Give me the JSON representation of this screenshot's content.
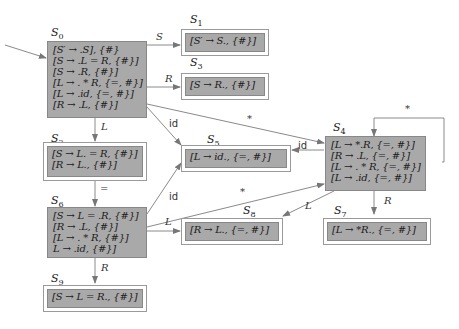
{
  "states": {
    "S0": {
      "label": "S",
      "sub": "0",
      "items": [
        "[S′ → .S], {#}",
        "[S → .L = R, {#}]",
        "[S → .R, {#}]",
        "[L → . * R, {=, #}]",
        "[L → .id, {=, #}]",
        "[R → .L, {#}]"
      ]
    },
    "S1": {
      "label": "S",
      "sub": "1",
      "items": [
        "[S′ → S., {#}]"
      ]
    },
    "S2": {
      "label": "S",
      "sub": "2",
      "items": [
        "[S → L. = R, {#}]",
        "[R → L., {#}]"
      ]
    },
    "S3": {
      "label": "S",
      "sub": "3",
      "items": [
        "[S → R., {#}]"
      ]
    },
    "S4": {
      "label": "S",
      "sub": "4",
      "items": [
        "[L → *.R, {=, #}]",
        "[R → .L, {=, #}]",
        "[L → . * R, {=, #}]",
        "[L → .id, {=, #}]"
      ]
    },
    "S5": {
      "label": "S",
      "sub": "5",
      "items": [
        "[L → id., {=, #}]"
      ]
    },
    "S6": {
      "label": "S",
      "sub": "6",
      "items": [
        "[S → L = .R, {#}]",
        "[R → .L, {#}]",
        "[L → . * R, {#}]",
        "L → .id, {#}]"
      ]
    },
    "S7": {
      "label": "S",
      "sub": "7",
      "items": [
        "[L → *R., {=, #}]"
      ]
    },
    "S8": {
      "label": "S",
      "sub": "8",
      "items": [
        "[R → L., {=, #}]"
      ]
    },
    "S9": {
      "label": "S",
      "sub": "9",
      "items": [
        "[S → L = R., {#}]"
      ]
    }
  },
  "edges": [
    {
      "from": "S0",
      "to": "S1",
      "label": "S"
    },
    {
      "from": "S0",
      "to": "S3",
      "label": "R"
    },
    {
      "from": "S0",
      "to": "S2",
      "label": "L"
    },
    {
      "from": "S0",
      "to": "S5",
      "label": "id"
    },
    {
      "from": "S0",
      "to": "S4",
      "label": "*"
    },
    {
      "from": "S2",
      "to": "S6",
      "label": "="
    },
    {
      "from": "S4",
      "to": "S5",
      "label": "id"
    },
    {
      "from": "S4",
      "to": "S4",
      "label": "*"
    },
    {
      "from": "S4",
      "to": "S8",
      "label": "L"
    },
    {
      "from": "S4",
      "to": "S7",
      "label": "R"
    },
    {
      "from": "S6",
      "to": "S5",
      "label": "id"
    },
    {
      "from": "S6",
      "to": "S4",
      "label": "*"
    },
    {
      "from": "S6",
      "to": "S8",
      "label": "L"
    },
    {
      "from": "S6",
      "to": "S9",
      "label": "R"
    }
  ],
  "colors": {
    "state_fill": "#a9a9a9",
    "edge": "#8a8a8a"
  }
}
